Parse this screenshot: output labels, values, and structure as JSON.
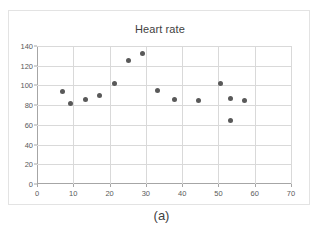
{
  "figure": {
    "caption": "(a)"
  },
  "chart_data": {
    "type": "scatter",
    "title": "Heart rate",
    "xlabel": "",
    "ylabel": "",
    "xlim": [
      0,
      70
    ],
    "ylim": [
      0,
      140
    ],
    "xticks": [
      0,
      10,
      20,
      30,
      40,
      50,
      60,
      70
    ],
    "yticks": [
      0,
      20,
      40,
      60,
      80,
      100,
      120,
      140
    ],
    "grid": true,
    "legend": false,
    "marker_color": "#595959",
    "gridline_color": "#d9d9d9",
    "axis_color": "#a6a6a6",
    "points": [
      {
        "x": 7.0,
        "y": 94
      },
      {
        "x": 9.3,
        "y": 82
      },
      {
        "x": 13.3,
        "y": 86
      },
      {
        "x": 17.3,
        "y": 90
      },
      {
        "x": 21.3,
        "y": 102
      },
      {
        "x": 25.3,
        "y": 125.5
      },
      {
        "x": 29.0,
        "y": 132
      },
      {
        "x": 33.3,
        "y": 95
      },
      {
        "x": 37.8,
        "y": 86
      },
      {
        "x": 44.5,
        "y": 85
      },
      {
        "x": 50.7,
        "y": 102
      },
      {
        "x": 53.3,
        "y": 86.5
      },
      {
        "x": 53.3,
        "y": 64.5
      },
      {
        "x": 57.3,
        "y": 84.5
      }
    ]
  }
}
